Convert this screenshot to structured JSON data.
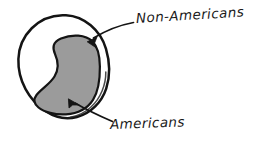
{
  "figure": {
    "type": "hand-drawn-venn-diagram",
    "background_color": "#ffffff",
    "ink_color": "#1a1a1a",
    "fill_color": "#9b9b9b",
    "outer_region": {
      "name": "outer-circle",
      "label": "Non-Americans",
      "shape": "circle"
    },
    "inner_region": {
      "name": "inner-blob",
      "label": "Americans",
      "shape": "comma-blob",
      "filled": true
    },
    "annotations": [
      {
        "name": "non-americans-callout",
        "text": "Non-Americans",
        "arrow": "curved-arrow-pointing-down-left"
      },
      {
        "name": "americans-callout",
        "text": "Americans",
        "arrow": "curved-arrow-pointing-up-left"
      }
    ]
  }
}
